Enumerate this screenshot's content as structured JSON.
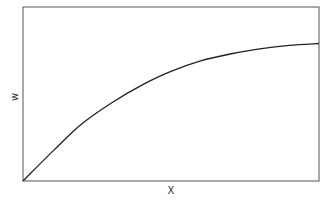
{
  "chart_data": {
    "type": "line",
    "title": "",
    "xlabel": "X",
    "ylabel": "w",
    "x_ticks": [],
    "y_ticks": [],
    "grid": false,
    "legend": null,
    "xlim": [
      0,
      1
    ],
    "ylim": [
      0,
      1
    ],
    "series": [
      {
        "name": "w",
        "color": "#222222",
        "x": [
          0.0,
          0.1,
          0.2,
          0.3,
          0.4,
          0.5,
          0.6,
          0.7,
          0.8,
          0.9,
          1.0
        ],
        "y": [
          0.0,
          0.17,
          0.33,
          0.45,
          0.55,
          0.63,
          0.69,
          0.73,
          0.76,
          0.78,
          0.79
        ]
      }
    ]
  },
  "plot": {
    "frame_color": "#555555",
    "line_color": "#222222",
    "background": "#ffffff"
  }
}
